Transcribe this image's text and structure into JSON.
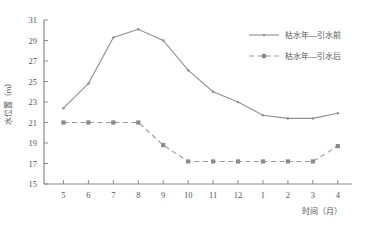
{
  "chart_data": {
    "type": "line",
    "title": "",
    "xlabel": "时间（月）",
    "ylabel": "水位置（m）",
    "categories": [
      "5",
      "6",
      "7",
      "8",
      "9",
      "10",
      "11",
      "12",
      "1",
      "2",
      "3",
      "4"
    ],
    "x": [
      5,
      6,
      7,
      8,
      9,
      10,
      11,
      12,
      1,
      2,
      3,
      4
    ],
    "xlim": [
      0,
      13
    ],
    "ylim": [
      15,
      31
    ],
    "yticks": [
      15,
      17,
      19,
      21,
      23,
      25,
      27,
      29,
      31
    ],
    "xticks": [
      "5",
      "6",
      "7",
      "8",
      "9",
      "10",
      "11",
      "12",
      "1",
      "2",
      "3",
      "4"
    ],
    "grid": false,
    "legend_position": "top-right",
    "series": [
      {
        "name": "枯水年—引水前",
        "style": "solid",
        "marker": "dot",
        "color": "#8f8f8f",
        "values": [
          22.4,
          24.8,
          29.3,
          30.1,
          29.0,
          26.1,
          24.0,
          23.0,
          21.7,
          21.4,
          21.4,
          21.9
        ]
      },
      {
        "name": "枯水年—引水后",
        "style": "dashed",
        "marker": "square",
        "color": "#9a9a9a",
        "values": [
          21.0,
          21.0,
          21.0,
          21.0,
          18.8,
          17.2,
          17.2,
          17.2,
          17.2,
          17.2,
          17.2,
          18.7
        ]
      }
    ]
  },
  "axis": {
    "y_title": "水位置（m）",
    "x_title": "时间（月）",
    "y_tick_labels": [
      "31",
      "29",
      "27",
      "25",
      "23",
      "21",
      "19",
      "17",
      "15"
    ],
    "x_tick_labels": [
      "5",
      "6",
      "7",
      "8",
      "9",
      "10",
      "11",
      "12",
      "1",
      "2",
      "3",
      "4"
    ]
  },
  "legend": {
    "entries": [
      {
        "label": "枯水年—引水前",
        "style": "solid"
      },
      {
        "label": "枯水年—引水后",
        "style": "dashed"
      }
    ]
  }
}
